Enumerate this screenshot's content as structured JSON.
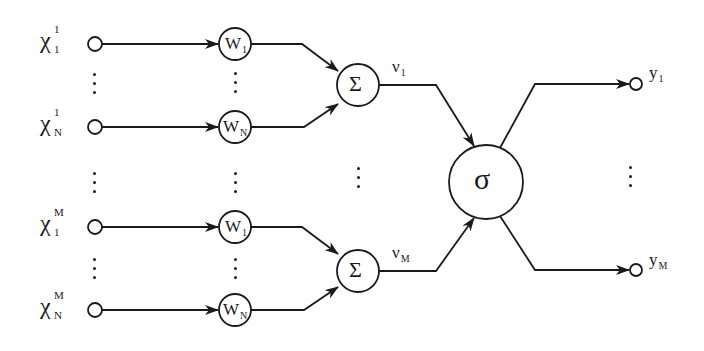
{
  "diagram": {
    "title": "",
    "inputs": [
      {
        "symbol": "χ",
        "sup": "1",
        "sub": "1"
      },
      {
        "symbol": "χ",
        "sup": "1",
        "sub": "N"
      },
      {
        "symbol": "χ",
        "sup": "M",
        "sub": "1"
      },
      {
        "symbol": "χ",
        "sup": "M",
        "sub": "N"
      }
    ],
    "weights": [
      {
        "symbol": "W",
        "sub": "1"
      },
      {
        "symbol": "W",
        "sub": "N"
      },
      {
        "symbol": "W",
        "sub": "1"
      },
      {
        "symbol": "W",
        "sub": "N"
      }
    ],
    "summations": [
      {
        "symbol": "Σ",
        "output_label": "ν",
        "output_sub": "1"
      },
      {
        "symbol": "Σ",
        "output_label": "ν",
        "output_sub": "M"
      }
    ],
    "activation": {
      "symbol": "σ"
    },
    "outputs": [
      {
        "symbol": "y",
        "sub": "1"
      },
      {
        "symbol": "y",
        "sub": "M"
      }
    ],
    "edges": [
      {
        "from": "x1_1",
        "to": "w1_top"
      },
      {
        "from": "x1_N",
        "to": "wN_top"
      },
      {
        "from": "xM_1",
        "to": "w1_bot"
      },
      {
        "from": "xM_N",
        "to": "wN_bot"
      },
      {
        "from": "w1_top",
        "to": "sum_1"
      },
      {
        "from": "wN_top",
        "to": "sum_1"
      },
      {
        "from": "w1_bot",
        "to": "sum_M"
      },
      {
        "from": "wN_bot",
        "to": "sum_M"
      },
      {
        "from": "sum_1",
        "to": "sigma",
        "label": "ν1"
      },
      {
        "from": "sum_M",
        "to": "sigma",
        "label": "νM"
      },
      {
        "from": "sigma",
        "to": "y1"
      },
      {
        "from": "sigma",
        "to": "yM"
      }
    ],
    "ellipsis": "⋮"
  }
}
